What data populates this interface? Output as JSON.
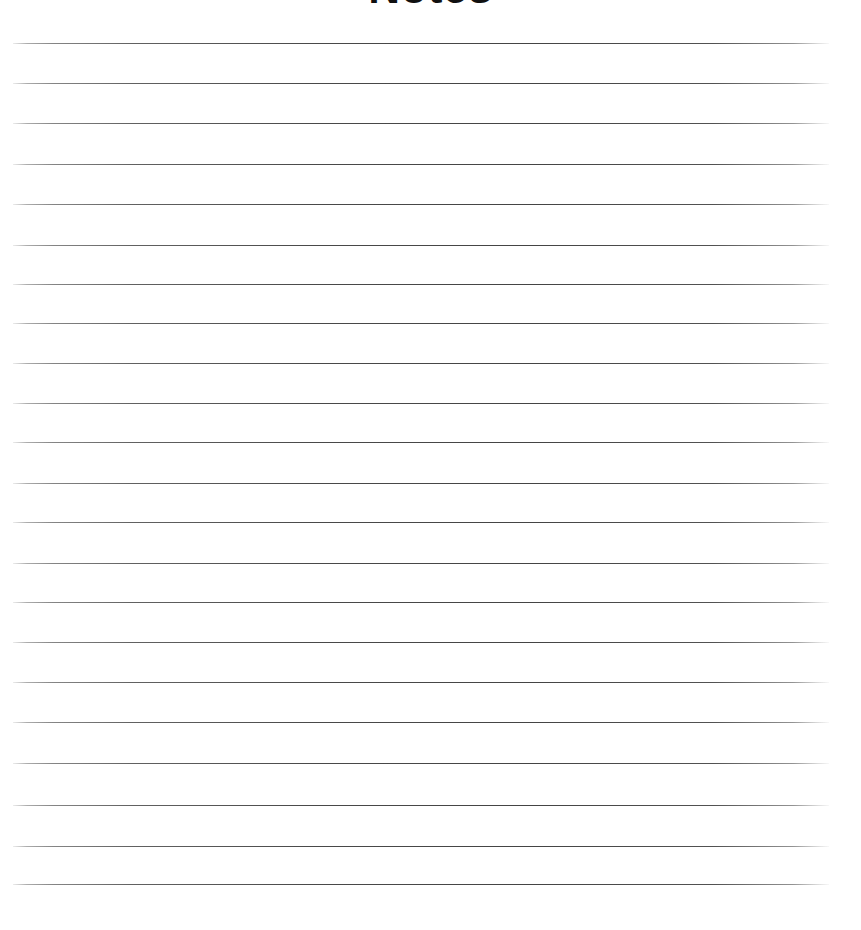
{
  "page": {
    "background_color": "#ffffff",
    "width": 861,
    "height": 930
  },
  "header": {
    "title": "Notes",
    "title_color": "#101010",
    "clipped_at_top": true
  },
  "notepad": {
    "line_count": 22,
    "line_color": "#3a3a3a",
    "line_start_x": 13,
    "line_end_x": 829,
    "line_spacing": 40.5,
    "first_line_y": 43,
    "lines": [
      {
        "index": 1,
        "y": 43,
        "text": ""
      },
      {
        "index": 2,
        "y": 83,
        "text": ""
      },
      {
        "index": 3,
        "y": 123,
        "text": ""
      },
      {
        "index": 4,
        "y": 164,
        "text": ""
      },
      {
        "index": 5,
        "y": 204,
        "text": ""
      },
      {
        "index": 6,
        "y": 245,
        "text": ""
      },
      {
        "index": 7,
        "y": 284,
        "text": ""
      },
      {
        "index": 8,
        "y": 323,
        "text": ""
      },
      {
        "index": 9,
        "y": 363,
        "text": ""
      },
      {
        "index": 10,
        "y": 403,
        "text": ""
      },
      {
        "index": 11,
        "y": 442,
        "text": ""
      },
      {
        "index": 12,
        "y": 483,
        "text": ""
      },
      {
        "index": 13,
        "y": 522,
        "text": ""
      },
      {
        "index": 14,
        "y": 563,
        "text": ""
      },
      {
        "index": 15,
        "y": 602,
        "text": ""
      },
      {
        "index": 16,
        "y": 642,
        "text": ""
      },
      {
        "index": 17,
        "y": 682,
        "text": ""
      },
      {
        "index": 18,
        "y": 722,
        "text": ""
      },
      {
        "index": 19,
        "y": 763,
        "text": ""
      },
      {
        "index": 20,
        "y": 805,
        "text": ""
      },
      {
        "index": 21,
        "y": 846,
        "text": ""
      },
      {
        "index": 22,
        "y": 884,
        "text": ""
      }
    ]
  }
}
